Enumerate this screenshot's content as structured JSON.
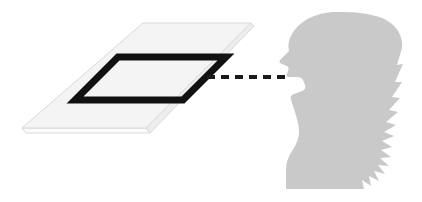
{
  "figure": {
    "title": "Sound wave passing through a planar frame toward a speaking head",
    "background_color": "#ffffff",
    "width": 422,
    "height": 202
  },
  "slab": {
    "name": "planar-slab",
    "description": "Light gray parallelogram plane drawn in perspective with a thin extruded front edge",
    "top_face_color": "#f4f4f4",
    "side_face_color": "#fbfbfb",
    "outline_color": "#d8d8d8",
    "top_face_points": "143,23 251,23 146,128 22,128",
    "front_edge_points": "22,128 146,128 150,133 26,133",
    "right_edge_points": "146,128 251,23 254,26 150,133"
  },
  "frame": {
    "name": "aperture-frame",
    "description": "Thick black parallelogram outline sitting on the slab, representing an aperture",
    "stroke_color": "#111111",
    "fill_color": "none",
    "stroke_width": 7,
    "points": "118,57 226,57 183,100 75,100"
  },
  "ray": {
    "name": "sound-ray",
    "description": "Horizontal black dashed line from the frame edge to the open mouth",
    "color": "#1a1a1a",
    "thickness": 4,
    "y": 77,
    "x_start": 207,
    "x_end": 287,
    "dash_pattern": "8 6",
    "dash_count": 7
  },
  "head": {
    "name": "head-silhouette",
    "description": "Gray silhouette of a person in left-facing profile with long hair, open mouth, neck and shoulder",
    "fill_color": "#c9c9c9",
    "facing": "left",
    "mouth_open": true,
    "features": [
      "forehead",
      "nose",
      "lips",
      "open-mouth",
      "chin",
      "neck",
      "shoulder",
      "long-hair",
      "wispy-hair-tips"
    ]
  },
  "palette": {
    "white": "#ffffff",
    "slab_gray": "#f4f4f4",
    "slab_outline": "#d8d8d8",
    "silhouette_gray": "#c9c9c9",
    "ink_black": "#111111"
  }
}
